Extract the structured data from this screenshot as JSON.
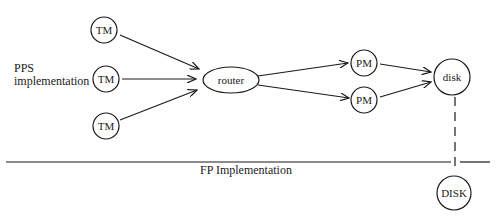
{
  "labels": {
    "pps_line1": "PPS",
    "pps_line2": "implementation",
    "fp": "FP Implementation"
  },
  "nodes": {
    "tm1": "TM",
    "tm2": "TM",
    "tm3": "TM",
    "router": "router",
    "pm1": "PM",
    "pm2": "PM",
    "disk": "disk",
    "disk_upper": "DISK"
  },
  "edges": [
    {
      "from": "tm1",
      "to": "router"
    },
    {
      "from": "tm2",
      "to": "router"
    },
    {
      "from": "tm3",
      "to": "router"
    },
    {
      "from": "router",
      "to": "pm1"
    },
    {
      "from": "router",
      "to": "pm2"
    },
    {
      "from": "pm1",
      "to": "disk"
    },
    {
      "from": "pm2",
      "to": "disk"
    },
    {
      "from": "disk",
      "to": "disk_upper",
      "style": "dashed"
    }
  ]
}
